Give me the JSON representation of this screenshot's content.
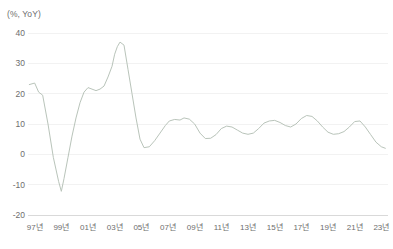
{
  "chart_data": {
    "type": "line",
    "title": "",
    "subtitle": "",
    "unit_label": "(%, YoY)",
    "xlabel": "",
    "ylabel": "",
    "ylim": [
      -20,
      40
    ],
    "yticks": [
      40,
      30,
      20,
      10,
      0,
      -10,
      -20
    ],
    "ytick_labels": [
      "40",
      "30",
      "20",
      "10",
      "0",
      "-10",
      "-20"
    ],
    "xlim": [
      1996.5,
      2023.5
    ],
    "xticks": [
      1997,
      1999,
      2001,
      2003,
      2005,
      2007,
      2009,
      2011,
      2013,
      2015,
      2017,
      2019,
      2021,
      2023
    ],
    "xtick_labels": [
      "97년",
      "99년",
      "01년",
      "03년",
      "05년",
      "07년",
      "09년",
      "11년",
      "13년",
      "15년",
      "17년",
      "19년",
      "21년",
      "23년"
    ],
    "grid": true,
    "grid_axis": "y",
    "legend": false,
    "legend_position": "none",
    "line_color": "#b9c4ba",
    "grid_color": "#f2f2f2",
    "axis_color": "#d9d9d9",
    "text_color": "#6d6d6d",
    "series": [
      {
        "name": "",
        "color": "#b9c4ba",
        "x": [
          1996.6,
          1997.0,
          1997.3,
          1997.6,
          1998.0,
          1998.4,
          1998.8,
          1999.0,
          1999.2,
          1999.5,
          1999.8,
          2000.1,
          2000.4,
          2000.7,
          2001.0,
          2001.3,
          2001.6,
          2001.9,
          2002.2,
          2002.5,
          2002.8,
          2003.0,
          2003.2,
          2003.4,
          2003.7,
          2004.0,
          2004.3,
          2004.6,
          2004.9,
          2005.2,
          2005.6,
          2006.0,
          2006.4,
          2006.8,
          2007.1,
          2007.5,
          2007.9,
          2008.2,
          2008.6,
          2009.0,
          2009.4,
          2009.8,
          2010.2,
          2010.6,
          2011.0,
          2011.4,
          2011.8,
          2012.2,
          2012.6,
          2013.0,
          2013.4,
          2013.8,
          2014.2,
          2014.6,
          2015.0,
          2015.4,
          2015.8,
          2016.2,
          2016.6,
          2017.0,
          2017.4,
          2017.8,
          2018.2,
          2018.6,
          2019.0,
          2019.4,
          2019.8,
          2020.2,
          2020.6,
          2021.0,
          2021.4,
          2021.8,
          2022.2,
          2022.6,
          2023.0,
          2023.3
        ],
        "y": [
          23.0,
          23.5,
          20.5,
          19.5,
          10.0,
          -1.0,
          -9.0,
          -12.2,
          -8.0,
          -1.0,
          6.0,
          12.0,
          17.0,
          20.5,
          22.0,
          21.5,
          21.0,
          21.5,
          22.5,
          25.5,
          29.0,
          33.0,
          35.5,
          37.0,
          36.0,
          28.0,
          20.0,
          12.0,
          5.0,
          2.2,
          2.5,
          4.5,
          7.0,
          9.5,
          11.0,
          11.5,
          11.3,
          12.0,
          11.6,
          10.0,
          7.0,
          5.2,
          5.3,
          6.5,
          8.5,
          9.3,
          9.0,
          8.0,
          7.0,
          6.6,
          7.0,
          8.5,
          10.3,
          11.0,
          11.2,
          10.5,
          9.5,
          9.0,
          10.0,
          11.8,
          12.8,
          12.5,
          11.0,
          9.0,
          7.3,
          6.6,
          6.8,
          7.5,
          9.0,
          10.8,
          11.0,
          9.0,
          6.5,
          4.0,
          2.5,
          2.0
        ]
      }
    ]
  }
}
